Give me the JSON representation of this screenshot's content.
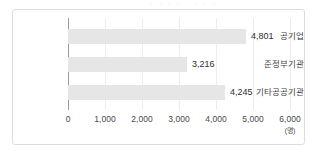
{
  "top_clipped_text": "· · · · · · · ·",
  "chart_data": {
    "type": "bar",
    "orientation": "horizontal",
    "title": "",
    "subtitle": "",
    "xlabel": "",
    "ylabel": "",
    "unit_label": "(명)",
    "categories": [
      "공기업",
      "준정부기관",
      "기타공공기관"
    ],
    "values": [
      4801,
      3216,
      4245
    ],
    "value_labels": [
      "4,801",
      "3,216",
      "4,245"
    ],
    "xlim": [
      0,
      6000
    ],
    "xticks": [
      0,
      1000,
      2000,
      3000,
      4000,
      5000,
      6000
    ],
    "xtick_labels": [
      "0",
      "1,000",
      "2,000",
      "3,000",
      "4,000",
      "5,000",
      "6,000"
    ],
    "grid": true,
    "legend": false,
    "bar_color": "#e6e6e6",
    "axis_color": "#9a9a9a",
    "grid_color": "#ededed",
    "frame_color": "#dcdcdc"
  }
}
